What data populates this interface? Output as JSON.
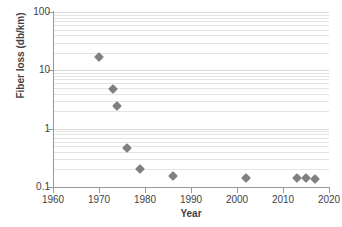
{
  "chart_data": {
    "type": "scatter",
    "title": "",
    "xlabel": "Year",
    "ylabel": "Fiber loss (db/km)",
    "xlim": [
      1960,
      2020
    ],
    "ylim": [
      0.1,
      100
    ],
    "yscale": "log",
    "xscale": "linear",
    "grid": true,
    "grid_axis": "y",
    "legend": false,
    "marker": "diamond",
    "marker_color": "#808080",
    "x_ticks": [
      1960,
      1970,
      1980,
      1990,
      2000,
      2010,
      2020
    ],
    "x_tick_labels": [
      "1960",
      "1970",
      "1980",
      "1990",
      "2000",
      "2010",
      "2020"
    ],
    "y_ticks": [
      0.1,
      1,
      10,
      100
    ],
    "y_tick_labels": [
      "0.1",
      "1",
      "10",
      "100"
    ],
    "series": [
      {
        "name": "Fiber loss",
        "points": [
          {
            "x": 1970,
            "y": 17
          },
          {
            "x": 1973,
            "y": 4.8
          },
          {
            "x": 1974,
            "y": 2.4
          },
          {
            "x": 1976,
            "y": 0.47
          },
          {
            "x": 1979,
            "y": 0.2
          },
          {
            "x": 1986,
            "y": 0.155
          },
          {
            "x": 2002,
            "y": 0.145
          },
          {
            "x": 2013,
            "y": 0.14
          },
          {
            "x": 2015,
            "y": 0.14
          },
          {
            "x": 2017,
            "y": 0.135
          }
        ]
      }
    ]
  },
  "colors": {
    "marker": "#808080",
    "gridline": "#d9d9d9",
    "gridline_minor": "#e4e4e4",
    "axis": "#9a9a9a",
    "text": "#3f3f3f",
    "background": "#ffffff"
  }
}
